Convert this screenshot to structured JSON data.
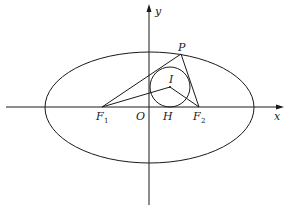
{
  "diagram": {
    "title": "",
    "axes": {
      "x_label": "x",
      "y_label": "y"
    },
    "points": {
      "P": {
        "label": "P"
      },
      "I": {
        "label": "I"
      },
      "O": {
        "label": "O"
      },
      "H": {
        "label": "H"
      },
      "F1": {
        "label": "F",
        "subscript": "1"
      },
      "F2": {
        "label": "F",
        "subscript": "2"
      }
    },
    "shapes": [
      "ellipse",
      "incircle",
      "triangle-PF1F2",
      "segment-IF1",
      "segment-IF2",
      "segment-IH"
    ],
    "colors": {
      "stroke": "#1a1a1a",
      "background": "#ffffff"
    }
  }
}
